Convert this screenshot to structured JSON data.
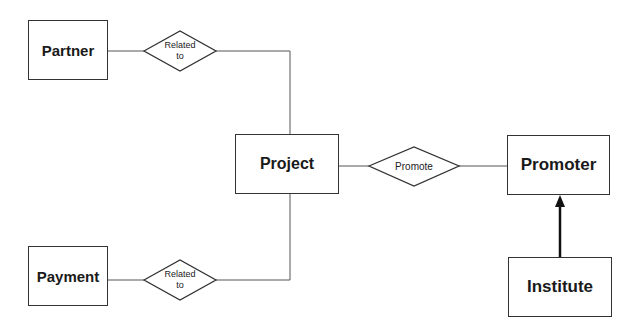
{
  "entities": [
    {
      "id": "partner",
      "label": "Partner",
      "x": 28,
      "y": 20,
      "w": 80,
      "h": 60,
      "fs": 15
    },
    {
      "id": "project",
      "label": "Project",
      "x": 235,
      "y": 134,
      "w": 104,
      "h": 60,
      "fs": 16
    },
    {
      "id": "promoter",
      "label": "Promoter",
      "x": 507,
      "y": 135,
      "w": 103,
      "h": 60,
      "fs": 17
    },
    {
      "id": "payment",
      "label": "Payment",
      "x": 28,
      "y": 246,
      "w": 80,
      "h": 60,
      "fs": 15
    },
    {
      "id": "institute",
      "label": "Institute",
      "x": 508,
      "y": 257,
      "w": 104,
      "h": 60,
      "fs": 17
    }
  ],
  "relationships": [
    {
      "id": "related-to-partner",
      "label": "Related\nto",
      "cx": 180,
      "cy": 51,
      "w": 72,
      "h": 40
    },
    {
      "id": "promote",
      "label": "Promote",
      "cx": 414,
      "cy": 166,
      "w": 90,
      "h": 39
    },
    {
      "id": "related-to-payment",
      "label": "Related\nto",
      "cx": 180,
      "cy": 280,
      "w": 72,
      "h": 40
    }
  ],
  "edges": [
    {
      "from": "partner",
      "to": "related-to-partner"
    },
    {
      "from": "related-to-partner",
      "to": "project"
    },
    {
      "from": "project",
      "to": "promote"
    },
    {
      "from": "promote",
      "to": "promoter"
    },
    {
      "from": "payment",
      "to": "related-to-payment"
    },
    {
      "from": "related-to-payment",
      "to": "project"
    },
    {
      "from": "institute",
      "to": "promoter",
      "type": "isa-arrow"
    }
  ]
}
